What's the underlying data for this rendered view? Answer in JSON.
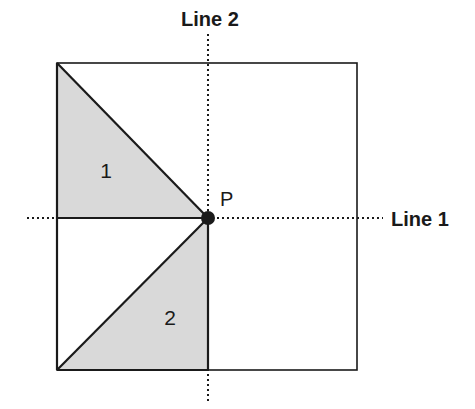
{
  "diagram": {
    "labels": {
      "line1": "Line 1",
      "line2": "Line 2",
      "point": "P",
      "region1": "1",
      "region2": "2"
    },
    "colors": {
      "stroke": "#1a1a1a",
      "shade": "#d9d9d9",
      "background": "#ffffff"
    },
    "square": {
      "x": 57,
      "y": 63,
      "width": 300,
      "height": 307
    },
    "point_P": {
      "x": 208,
      "y": 218
    }
  }
}
